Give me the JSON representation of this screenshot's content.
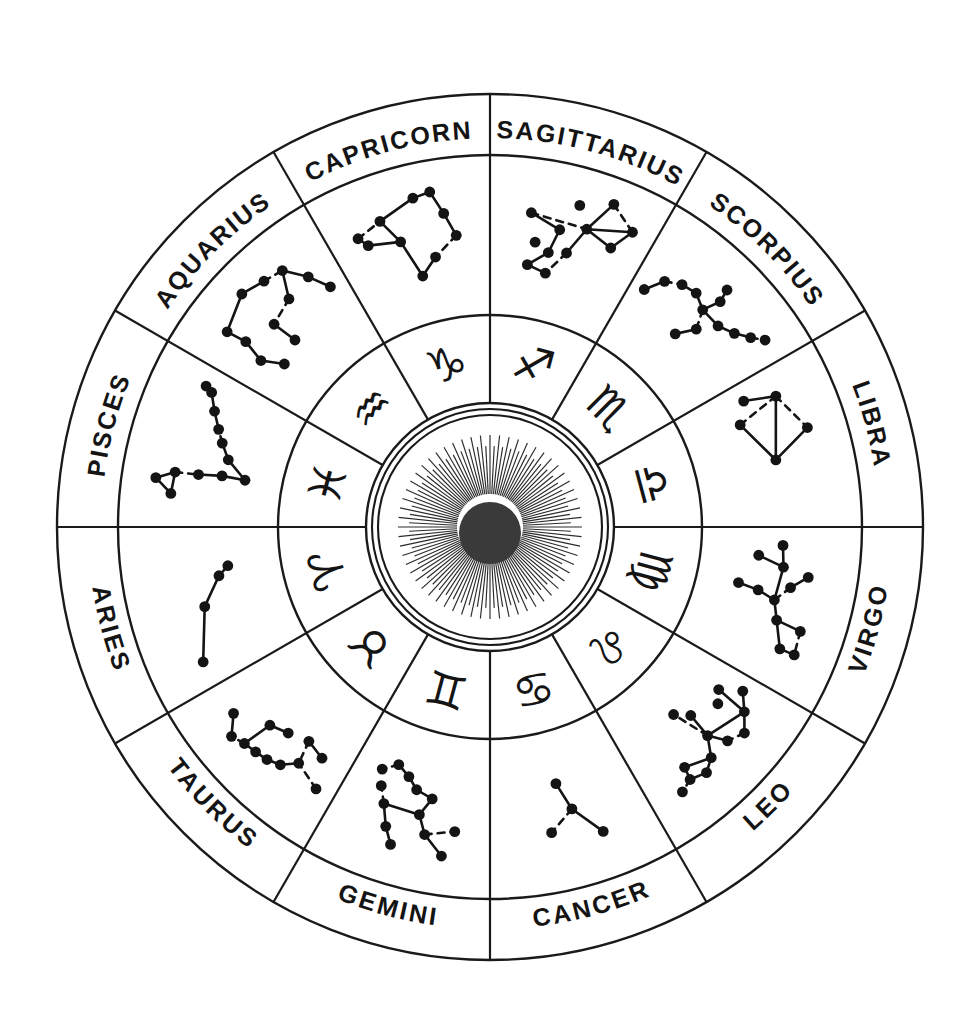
{
  "diagram": {
    "center_emblem": "sun-with-rays",
    "geometry": {
      "center_x": 490,
      "center_y": 527,
      "outer_radius": 433,
      "label_ring_inner_radius": 372,
      "constellation_ring_inner_radius": 212,
      "glyph_ring_inner_radius": 124,
      "sun_disc_outer_radius": 118,
      "sun_disc_inner_radius": 112,
      "sun_ray_outer_radius": 92,
      "sun_ray_inner_radius": 33,
      "sun_core_radius": 31,
      "sun_ray_count": 120,
      "sector_count": 12,
      "sector_span_degrees": 30
    },
    "colors": {
      "ink": "#141414",
      "line": "#1a1a1a",
      "background": "#ffffff",
      "sun_core": "#3a3a3a",
      "sun_ray": "#2b2b2b"
    }
  },
  "signs": [
    {
      "label": "SAGITTARIUS",
      "glyph": "♐",
      "glyph_name": "sagittarius-glyph",
      "start_angle": -90,
      "end_angle": -60,
      "mid_angle": -75,
      "stars": [
        [
          0.52,
          0.17
        ],
        [
          0.7,
          0.08
        ],
        [
          0.86,
          0.22
        ],
        [
          0.78,
          0.4
        ],
        [
          0.6,
          0.33
        ],
        [
          0.44,
          0.39
        ],
        [
          0.4,
          0.58
        ],
        [
          0.3,
          0.52
        ],
        [
          0.27,
          0.7
        ],
        [
          0.41,
          0.74
        ],
        [
          0.52,
          0.55
        ],
        [
          0.25,
          0.3
        ]
      ],
      "links": [
        [
          11,
          4
        ],
        [
          4,
          2
        ],
        [
          2,
          3
        ],
        [
          3,
          4
        ],
        [
          4,
          10
        ],
        [
          10,
          9
        ],
        [
          9,
          8
        ],
        [
          8,
          6
        ],
        [
          6,
          5
        ],
        [
          5,
          11
        ],
        [
          1,
          2
        ],
        [
          4,
          1
        ]
      ]
    },
    {
      "label": "CAPRICORN",
      "glyph": "♑",
      "glyph_name": "capricorn-glyph",
      "start_angle": -120,
      "end_angle": -90,
      "mid_angle": -105,
      "stars": [
        [
          0.18,
          0.3
        ],
        [
          0.22,
          0.38
        ],
        [
          0.34,
          0.24
        ],
        [
          0.56,
          0.14
        ],
        [
          0.66,
          0.12
        ],
        [
          0.72,
          0.3
        ],
        [
          0.78,
          0.48
        ],
        [
          0.62,
          0.62
        ],
        [
          0.5,
          0.74
        ],
        [
          0.42,
          0.44
        ]
      ],
      "links": [
        [
          0,
          1
        ],
        [
          0,
          2
        ],
        [
          2,
          3
        ],
        [
          3,
          4
        ],
        [
          4,
          5
        ],
        [
          5,
          6
        ],
        [
          6,
          7
        ],
        [
          7,
          8
        ],
        [
          8,
          9
        ],
        [
          9,
          2
        ],
        [
          1,
          9
        ]
      ]
    },
    {
      "label": "AQUARIUS",
      "glyph": "♒",
      "glyph_name": "aquarius-glyph",
      "start_angle": -150,
      "end_angle": -120,
      "mid_angle": -135,
      "stars": [
        [
          0.22,
          0.22
        ],
        [
          0.44,
          0.12
        ],
        [
          0.58,
          0.17
        ],
        [
          0.7,
          0.2
        ],
        [
          0.24,
          0.38
        ],
        [
          0.2,
          0.56
        ],
        [
          0.28,
          0.72
        ],
        [
          0.44,
          0.46
        ],
        [
          0.46,
          0.66
        ],
        [
          0.62,
          0.4
        ],
        [
          0.8,
          0.36
        ],
        [
          0.88,
          0.52
        ]
      ],
      "links": [
        [
          0,
          1
        ],
        [
          1,
          2
        ],
        [
          2,
          3
        ],
        [
          0,
          4
        ],
        [
          4,
          5
        ],
        [
          5,
          6
        ],
        [
          3,
          9
        ],
        [
          9,
          7
        ],
        [
          7,
          8
        ],
        [
          3,
          10
        ],
        [
          10,
          11
        ]
      ]
    },
    {
      "label": "PISCES",
      "glyph": "♓",
      "glyph_name": "pisces-glyph",
      "start_angle": 180,
      "end_angle": -150,
      "mid_angle": -165,
      "stars": [
        [
          0.28,
          0.14
        ],
        [
          0.2,
          0.27
        ],
        [
          0.33,
          0.28
        ],
        [
          0.34,
          0.46
        ],
        [
          0.36,
          0.64
        ],
        [
          0.36,
          0.82
        ],
        [
          0.48,
          0.66
        ],
        [
          0.58,
          0.58
        ],
        [
          0.66,
          0.52
        ],
        [
          0.76,
          0.44
        ],
        [
          0.86,
          0.36
        ],
        [
          0.88,
          0.3
        ]
      ],
      "links": [
        [
          0,
          1
        ],
        [
          1,
          2
        ],
        [
          0,
          2
        ],
        [
          2,
          3
        ],
        [
          3,
          4
        ],
        [
          4,
          5
        ],
        [
          5,
          6
        ],
        [
          6,
          7
        ],
        [
          7,
          8
        ],
        [
          8,
          9
        ],
        [
          9,
          10
        ],
        [
          10,
          11
        ]
      ]
    },
    {
      "label": "ARIES",
      "glyph": "♈",
      "glyph_name": "aries-glyph",
      "start_angle": 150,
      "end_angle": 180,
      "mid_angle": 165,
      "stars": [
        [
          0.16,
          0.3
        ],
        [
          0.48,
          0.46
        ],
        [
          0.66,
          0.62
        ],
        [
          0.72,
          0.7
        ]
      ],
      "links": [
        [
          0,
          1
        ],
        [
          1,
          2
        ],
        [
          2,
          3
        ]
      ]
    },
    {
      "label": "TAURUS",
      "glyph": "♉",
      "glyph_name": "taurus-glyph",
      "start_angle": 120,
      "end_angle": 150,
      "mid_angle": 135,
      "stars": [
        [
          0.12,
          0.32
        ],
        [
          0.3,
          0.4
        ],
        [
          0.38,
          0.3
        ],
        [
          0.46,
          0.26
        ],
        [
          0.54,
          0.24
        ],
        [
          0.62,
          0.22
        ],
        [
          0.7,
          0.18
        ],
        [
          0.8,
          0.3
        ],
        [
          0.6,
          0.46
        ],
        [
          0.48,
          0.52
        ],
        [
          0.2,
          0.54
        ],
        [
          0.34,
          0.58
        ]
      ],
      "links": [
        [
          0,
          1
        ],
        [
          1,
          2
        ],
        [
          2,
          3
        ],
        [
          3,
          4
        ],
        [
          4,
          5
        ],
        [
          5,
          6
        ],
        [
          6,
          7
        ],
        [
          5,
          8
        ],
        [
          8,
          9
        ],
        [
          10,
          11
        ],
        [
          11,
          1
        ]
      ]
    },
    {
      "label": "GEMINI",
      "glyph": "♊",
      "glyph_name": "gemini-glyph",
      "start_angle": 90,
      "end_angle": 120,
      "mid_angle": 105,
      "stars": [
        [
          0.28,
          0.18
        ],
        [
          0.22,
          0.38
        ],
        [
          0.4,
          0.32
        ],
        [
          0.46,
          0.46
        ],
        [
          0.4,
          0.6
        ],
        [
          0.52,
          0.64
        ],
        [
          0.6,
          0.72
        ],
        [
          0.7,
          0.78
        ],
        [
          0.64,
          0.3
        ],
        [
          0.7,
          0.46
        ],
        [
          0.76,
          0.58
        ],
        [
          0.58,
          0.18
        ],
        [
          0.8,
          0.7
        ]
      ],
      "links": [
        [
          0,
          2
        ],
        [
          2,
          1
        ],
        [
          2,
          3
        ],
        [
          3,
          4
        ],
        [
          3,
          9
        ],
        [
          9,
          8
        ],
        [
          9,
          10
        ],
        [
          4,
          5
        ],
        [
          5,
          6
        ],
        [
          6,
          7
        ],
        [
          11,
          8
        ],
        [
          7,
          12
        ]
      ]
    },
    {
      "label": "CANCER",
      "glyph": "♋",
      "glyph_name": "cancer-glyph",
      "start_angle": 60,
      "end_angle": 90,
      "mid_angle": 75,
      "stars": [
        [
          0.32,
          0.24
        ],
        [
          0.46,
          0.48
        ],
        [
          0.52,
          0.7
        ],
        [
          0.62,
          0.34
        ]
      ],
      "links": [
        [
          0,
          1
        ],
        [
          1,
          2
        ],
        [
          1,
          3
        ]
      ]
    },
    {
      "label": "LEO",
      "glyph": "♌",
      "glyph_name": "leo-glyph",
      "start_angle": 30,
      "end_angle": 60,
      "mid_angle": 45,
      "stars": [
        [
          0.1,
          0.42
        ],
        [
          0.2,
          0.32
        ],
        [
          0.18,
          0.58
        ],
        [
          0.3,
          0.22
        ],
        [
          0.26,
          0.52
        ],
        [
          0.4,
          0.28
        ],
        [
          0.46,
          0.42
        ],
        [
          0.54,
          0.28
        ],
        [
          0.62,
          0.22
        ],
        [
          0.72,
          0.26
        ],
        [
          0.8,
          0.22
        ],
        [
          0.7,
          0.36
        ],
        [
          0.44,
          0.62
        ],
        [
          0.52,
          0.72
        ]
      ],
      "links": [
        [
          0,
          1
        ],
        [
          1,
          2
        ],
        [
          1,
          3
        ],
        [
          3,
          5
        ],
        [
          5,
          6
        ],
        [
          6,
          7
        ],
        [
          7,
          8
        ],
        [
          8,
          9
        ],
        [
          9,
          10
        ],
        [
          9,
          11
        ],
        [
          11,
          7
        ],
        [
          1,
          6
        ],
        [
          6,
          12
        ],
        [
          6,
          13
        ]
      ]
    },
    {
      "label": "VIRGO",
      "glyph": "♍",
      "glyph_name": "virgo-glyph",
      "start_angle": 0,
      "end_angle": 30,
      "mid_angle": 15,
      "stars": [
        [
          0.12,
          0.48
        ],
        [
          0.26,
          0.46
        ],
        [
          0.2,
          0.66
        ],
        [
          0.3,
          0.26
        ],
        [
          0.38,
          0.38
        ],
        [
          0.48,
          0.48
        ],
        [
          0.44,
          0.62
        ],
        [
          0.42,
          0.78
        ],
        [
          0.6,
          0.42
        ],
        [
          0.62,
          0.22
        ],
        [
          0.76,
          0.2
        ],
        [
          0.76,
          0.32
        ]
      ],
      "links": [
        [
          0,
          1
        ],
        [
          1,
          2
        ],
        [
          1,
          5
        ],
        [
          3,
          4
        ],
        [
          4,
          5
        ],
        [
          5,
          6
        ],
        [
          6,
          7
        ],
        [
          5,
          8
        ],
        [
          8,
          9
        ],
        [
          9,
          10
        ],
        [
          10,
          11
        ],
        [
          11,
          8
        ]
      ]
    },
    {
      "label": "LIBRA",
      "glyph": "♎",
      "glyph_name": "libra-glyph",
      "start_angle": -30,
      "end_angle": 0,
      "mid_angle": -15,
      "stars": [
        [
          0.18,
          0.32
        ],
        [
          0.42,
          0.18
        ],
        [
          0.56,
          0.48
        ],
        [
          0.12,
          0.56
        ],
        [
          0.26,
          0.66
        ]
      ],
      "links": [
        [
          0,
          1
        ],
        [
          1,
          2
        ],
        [
          0,
          2
        ],
        [
          0,
          3
        ],
        [
          2,
          4
        ],
        [
          4,
          0
        ]
      ]
    },
    {
      "label": "SCORPIUS",
      "glyph": "♏",
      "glyph_name": "scorpius-glyph",
      "start_angle": -60,
      "end_angle": -30,
      "mid_angle": -45,
      "stars": [
        [
          0.1,
          0.56
        ],
        [
          0.18,
          0.42
        ],
        [
          0.28,
          0.36
        ],
        [
          0.38,
          0.34
        ],
        [
          0.48,
          0.4
        ],
        [
          0.52,
          0.26
        ],
        [
          0.5,
          0.16
        ],
        [
          0.54,
          0.54
        ],
        [
          0.46,
          0.68
        ],
        [
          0.62,
          0.4
        ],
        [
          0.72,
          0.34
        ],
        [
          0.8,
          0.26
        ],
        [
          0.86,
          0.18
        ]
      ],
      "links": [
        [
          0,
          1
        ],
        [
          1,
          2
        ],
        [
          2,
          3
        ],
        [
          3,
          4
        ],
        [
          4,
          5
        ],
        [
          5,
          6
        ],
        [
          4,
          7
        ],
        [
          7,
          8
        ],
        [
          4,
          9
        ],
        [
          9,
          10
        ],
        [
          10,
          11
        ],
        [
          11,
          12
        ]
      ]
    }
  ]
}
